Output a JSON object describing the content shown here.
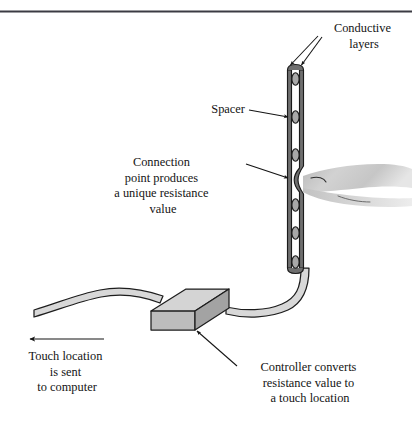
{
  "figure": {
    "background_color": "#ffffff",
    "ink_color": "#141414",
    "top_rule_color": "#3b3b43"
  },
  "labels": {
    "conductive_layers": {
      "name": "conductive-layers-label",
      "lines": [
        "Conductive",
        "layers"
      ]
    },
    "spacer": {
      "name": "spacer-label",
      "lines": [
        "Spacer"
      ]
    },
    "connection_point": {
      "name": "connection-point-label",
      "lines": [
        "Connection",
        "point produces",
        "a unique resistance",
        "value"
      ]
    },
    "touch_location": {
      "name": "touch-location-label",
      "lines": [
        "Touch location",
        "is sent",
        "to computer"
      ]
    },
    "controller": {
      "name": "controller-label",
      "lines": [
        "Controller converts",
        "resistance value to",
        "a touch location"
      ]
    }
  },
  "parts": {
    "panel": {
      "name": "touchscreen-panel",
      "spacer_count": 6,
      "layer_fill": "#6f6f6f",
      "gap_fill": "#ffffff",
      "spacer_fill": "#a8a8a8"
    },
    "finger": {
      "name": "finger-touching-screen",
      "fill": "#c9c9c9"
    },
    "controller_box": {
      "name": "controller-box",
      "top_fill": "#d4d4d4",
      "front_fill": "#b5b5b5",
      "side_fill": "#9a9a9a"
    },
    "cable": {
      "name": "ribbon-cable",
      "fill": "#d8d8d8"
    },
    "signal_arrow": {
      "name": "signal-direction-arrow",
      "direction": "left"
    }
  }
}
